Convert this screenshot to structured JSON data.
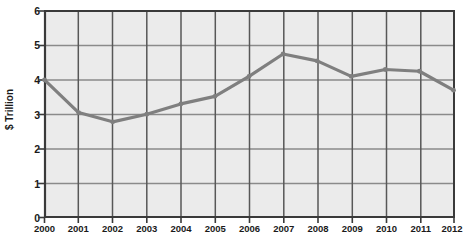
{
  "chart_data": {
    "type": "line",
    "title": "",
    "xlabel": "",
    "ylabel": "$ Trillion",
    "categories": [
      "2000",
      "2001",
      "2002",
      "2003",
      "2004",
      "2005",
      "2006",
      "2007",
      "2008",
      "2009",
      "2010",
      "2011",
      "2012"
    ],
    "values": [
      4.0,
      3.05,
      2.78,
      3.0,
      3.3,
      3.52,
      4.1,
      4.75,
      4.55,
      4.1,
      4.3,
      4.25,
      3.7
    ],
    "series": [
      {
        "name": "$ Trillion",
        "values": [
          4.0,
          3.05,
          2.78,
          3.0,
          3.3,
          3.52,
          4.1,
          4.75,
          4.55,
          4.1,
          4.3,
          4.25,
          3.7
        ]
      }
    ],
    "ylim": [
      0,
      6
    ],
    "y_ticks": [
      0,
      1,
      2,
      3,
      4,
      5,
      6
    ],
    "y_tick_labels": [
      "0",
      "1",
      "2",
      "3",
      "4",
      "5",
      "6"
    ],
    "x_tick_labels": [
      "2000",
      "2001",
      "2002",
      "2003",
      "2004",
      "2005",
      "2006",
      "2007",
      "2008",
      "2009",
      "2010",
      "2011",
      "2012"
    ],
    "grid": true,
    "legend": "none",
    "colors": {
      "line": "#7f7f7f",
      "plot_background": "#ebebeb",
      "gridline": "#8c8c8c",
      "axis": "#3a3a3a",
      "text": "#1a1a1a",
      "watermark": "#f3f3f3"
    },
    "annotations": {
      "watermark_line1": "Hoovers",
      "watermark_line2": "A D&B Company"
    }
  }
}
